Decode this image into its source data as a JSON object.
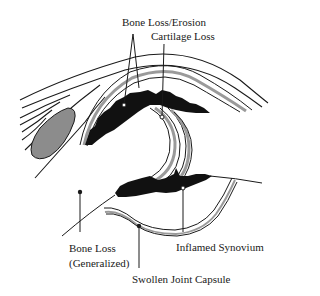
{
  "diagram": {
    "labels": {
      "bone_loss_erosion": "Bone Loss/Erosion",
      "cartilage_loss": "Cartilage Loss",
      "bone_loss_generalized_line1": "Bone Loss",
      "bone_loss_generalized_line2": "(Generalized)",
      "inflamed_synovium": "Inflamed Synovium",
      "swollen_joint_capsule": "Swollen Joint Capsule"
    },
    "colors": {
      "ink": "#1a1a1a",
      "cartilage_fill": "#9a9a9a",
      "bursa_fill": "#8c8c8c",
      "background": "#ffffff"
    }
  }
}
